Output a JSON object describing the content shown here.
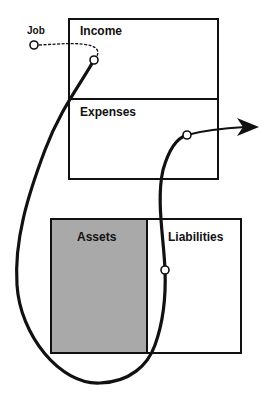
{
  "diagram": {
    "type": "cashflow-diagram",
    "colors": {
      "line": "#111111",
      "assets_fill": "#a9a9a9",
      "box_fill": "#ffffff",
      "background": "#ffffff"
    },
    "labels": {
      "job": "Job",
      "income": "Income",
      "expenses": "Expenses",
      "assets": "Assets",
      "liabilities": "Liabilities"
    },
    "statements": [
      {
        "name": "income-statement",
        "sections": [
          "Income",
          "Expenses"
        ]
      },
      {
        "name": "balance-sheet",
        "sections": [
          "Assets",
          "Liabilities"
        ]
      }
    ],
    "flow": {
      "path_order": [
        "Job",
        "Income",
        "Assets",
        "Liabilities",
        "Expenses",
        "out"
      ],
      "arrow": "right"
    }
  }
}
